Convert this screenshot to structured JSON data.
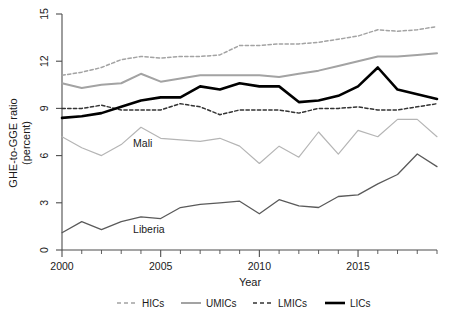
{
  "chart_data": {
    "type": "line",
    "title": "",
    "xlabel": "Year",
    "ylabel": "GHE-to-GGE ratio (percent)",
    "ylabel_line1": "GHE-to-GGE ratio",
    "ylabel_line2": "(percent)",
    "xlim": [
      2000,
      2019
    ],
    "ylim": [
      0,
      15
    ],
    "grid": false,
    "legend_position": "bottom",
    "x": [
      2000,
      2001,
      2002,
      2003,
      2004,
      2005,
      2006,
      2007,
      2008,
      2009,
      2010,
      2011,
      2012,
      2013,
      2014,
      2015,
      2016,
      2017,
      2018,
      2019
    ],
    "y_ticks": [
      0,
      3,
      6,
      9,
      12,
      15
    ],
    "y_tick_labels": [
      "0",
      "3",
      "6",
      "9",
      "12",
      "15"
    ],
    "x_ticks": [
      2000,
      2005,
      2010,
      2015
    ],
    "x_tick_labels": [
      "2000",
      "2005",
      "2010",
      "2015"
    ],
    "x_minor_ticks": [
      2000,
      2001,
      2002,
      2003,
      2004,
      2005,
      2006,
      2007,
      2008,
      2009,
      2010,
      2011,
      2012,
      2013,
      2014,
      2015,
      2016,
      2017,
      2018,
      2019
    ],
    "series": [
      {
        "name": "HICs",
        "style": "dashed",
        "color": "#a3a3a3",
        "width": 1.5,
        "values": [
          11.1,
          11.3,
          11.6,
          12.1,
          12.3,
          12.2,
          12.3,
          12.3,
          12.4,
          13.0,
          13.0,
          13.1,
          13.1,
          13.2,
          13.4,
          13.6,
          14.0,
          13.9,
          14.0,
          14.2
        ]
      },
      {
        "name": "UMICs",
        "style": "solid",
        "color": "#a3a3a3",
        "width": 2.0,
        "values": [
          10.6,
          10.3,
          10.5,
          10.6,
          11.2,
          10.7,
          10.9,
          11.1,
          11.1,
          11.1,
          11.1,
          11.0,
          11.2,
          11.4,
          11.7,
          12.0,
          12.3,
          12.3,
          12.4,
          12.5
        ]
      },
      {
        "name": "LMICs",
        "style": "dashed",
        "color": "#333333",
        "width": 1.5,
        "values": [
          9.0,
          9.0,
          9.2,
          8.9,
          8.9,
          8.9,
          9.3,
          9.1,
          8.6,
          8.9,
          8.9,
          8.9,
          8.7,
          9.0,
          9.0,
          9.1,
          8.9,
          8.9,
          9.1,
          9.3
        ]
      },
      {
        "name": "LICs",
        "style": "solid",
        "color": "#000000",
        "width": 2.6,
        "values": [
          8.4,
          8.5,
          8.7,
          9.1,
          9.5,
          9.7,
          9.7,
          10.4,
          10.2,
          10.6,
          10.4,
          10.4,
          9.4,
          9.5,
          9.8,
          10.4,
          11.6,
          10.2,
          9.9,
          9.6
        ]
      },
      {
        "name": "Mali",
        "style": "solid",
        "color": "#b5b5b5",
        "width": 1.2,
        "values": [
          7.2,
          6.5,
          6.0,
          6.7,
          7.8,
          7.1,
          7.0,
          6.9,
          7.1,
          6.6,
          5.5,
          6.6,
          5.9,
          7.5,
          6.1,
          7.6,
          7.2,
          8.3,
          8.3,
          7.2
        ]
      },
      {
        "name": "Liberia",
        "style": "solid",
        "color": "#5a5a5a",
        "width": 1.3,
        "values": [
          1.1,
          1.8,
          1.3,
          1.8,
          2.1,
          2.0,
          2.7,
          2.9,
          3.0,
          3.1,
          2.3,
          3.2,
          2.8,
          2.7,
          3.4,
          3.5,
          4.2,
          4.8,
          6.1,
          5.3
        ]
      }
    ],
    "annotations": [
      {
        "text": "Mali",
        "x": 2003.6,
        "y": 6.55
      },
      {
        "text": "Liberia",
        "x": 2003.6,
        "y": 1.1
      }
    ],
    "legend": [
      {
        "label": "HICs",
        "style": "dashed",
        "color": "#a3a3a3",
        "width": 1.5
      },
      {
        "label": "UMICs",
        "style": "solid",
        "color": "#a3a3a3",
        "width": 2.0
      },
      {
        "label": "LMICs",
        "style": "dashed",
        "color": "#333333",
        "width": 1.5
      },
      {
        "label": "LICs",
        "style": "solid",
        "color": "#000000",
        "width": 2.6
      }
    ]
  }
}
